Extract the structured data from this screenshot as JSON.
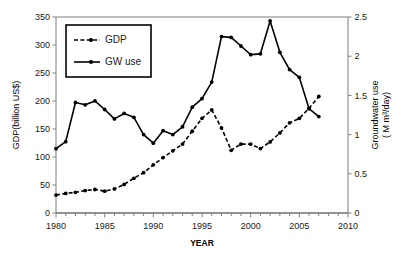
{
  "chart_data": {
    "type": "line",
    "title": "",
    "xlabel": "YEAR",
    "ylabel": "GDP(billion US$)",
    "ylabel_secondary": "Groundwater use (M m³/day)",
    "xlim": [
      1980,
      2010
    ],
    "ylim": [
      0,
      350
    ],
    "ylim_secondary": [
      0,
      2.5
    ],
    "xticks": [
      1980,
      1985,
      1990,
      1995,
      2000,
      2005,
      2010
    ],
    "xtick_labels": [
      "1980",
      "1985",
      "1990",
      "1995",
      "2000",
      "2005",
      "2010"
    ],
    "xminor_step": 1,
    "yticks": [
      0,
      50,
      100,
      150,
      200,
      250,
      300,
      350
    ],
    "ytick_labels": [
      "0",
      "50",
      "100",
      "150",
      "200",
      "250",
      "300",
      "350"
    ],
    "yticks_secondary": [
      0,
      0.5,
      1,
      1.5,
      2,
      2.5
    ],
    "ytick_labels_secondary": [
      "0",
      "0.5",
      "1",
      "1.5",
      "2",
      "2.5"
    ],
    "grid": false,
    "legend_position": "upper-left",
    "series": [
      {
        "name": "GDP",
        "axis": "left",
        "unit": "billion US$",
        "style": "dashed",
        "marker": "circle",
        "color": "#000000",
        "x": [
          1980,
          1981,
          1982,
          1983,
          1984,
          1985,
          1986,
          1987,
          1988,
          1989,
          1990,
          1991,
          1992,
          1993,
          1994,
          1995,
          1996,
          1997,
          1998,
          1999,
          2000,
          2001,
          2002,
          2003,
          2004,
          2005,
          2006,
          2007
        ],
        "values": [
          32,
          35,
          37,
          40,
          42,
          39,
          43,
          51,
          62,
          72,
          86,
          99,
          111,
          123,
          146,
          169,
          184,
          152,
          112,
          123,
          123,
          115,
          127,
          143,
          161,
          169,
          187,
          208
        ]
      },
      {
        "name": "GW use",
        "axis": "right",
        "unit": "M m³/day",
        "style": "solid",
        "marker": "circle",
        "color": "#000000",
        "x": [
          1980,
          1981,
          1982,
          1983,
          1984,
          1985,
          1986,
          1987,
          1988,
          1989,
          1990,
          1991,
          1992,
          1993,
          1994,
          1995,
          1996,
          1997,
          1998,
          1999,
          2000,
          2001,
          2002,
          2003,
          2004,
          2005,
          2006,
          2007
        ],
        "values": [
          0.82,
          0.91,
          1.41,
          1.38,
          1.43,
          1.32,
          1.2,
          1.27,
          1.22,
          1.0,
          0.89,
          1.05,
          1.0,
          1.1,
          1.35,
          1.46,
          1.67,
          2.25,
          2.24,
          2.13,
          2.02,
          2.03,
          2.45,
          2.05,
          1.83,
          1.73,
          1.33,
          1.23
        ]
      }
    ]
  },
  "legend": {
    "entries": [
      {
        "label": "GDP",
        "style": "dashed"
      },
      {
        "label": "GW use",
        "style": "solid"
      }
    ]
  },
  "axes": {
    "x_title": "YEAR",
    "y_left_title": "GDP(billion US$)",
    "y_right_title_line1": "Groundwater use",
    "y_right_title_line2": "( M m³/day)"
  }
}
